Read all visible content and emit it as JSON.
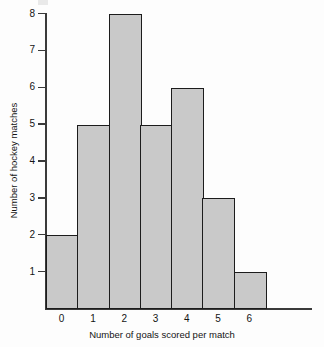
{
  "chart_data": {
    "type": "bar",
    "title": "",
    "subtitle": "",
    "xlabel": "Number of goals scored per match",
    "ylabel": "Number of hockey matches",
    "categories": [
      "0",
      "1",
      "2",
      "3",
      "4",
      "5",
      "6"
    ],
    "values": [
      2,
      5,
      8,
      5,
      6,
      3,
      1
    ],
    "series": [
      {
        "name": "Number of hockey matches",
        "values": [
          2,
          5,
          8,
          5,
          6,
          3,
          1
        ]
      }
    ],
    "ylim": [
      0,
      8
    ],
    "xlim": [
      -0.5,
      6.5
    ],
    "y_ticks": [
      1,
      2,
      3,
      4,
      5,
      6,
      7,
      8
    ],
    "y_tick_labels": [
      "1",
      "2",
      "3",
      "4",
      "5",
      "6",
      "7",
      "8"
    ],
    "x_ticks": [
      0,
      1,
      2,
      3,
      4,
      5,
      6
    ],
    "x_tick_labels": [
      "0",
      "1",
      "2",
      "3",
      "4",
      "5",
      "6"
    ],
    "grid": false,
    "legend": false,
    "legend_position": "none",
    "annotations": [],
    "bar_gap": 0,
    "colors": {
      "bar_fill": "#c9c9c9",
      "bar_edge": "#1c1c1c",
      "axis": "#3a3a3a",
      "text": "#141414",
      "background": "#fdfdfd"
    }
  }
}
